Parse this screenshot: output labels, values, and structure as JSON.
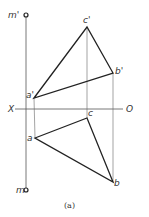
{
  "figure": {
    "caption": "(a)",
    "axis": {
      "left_label": "X",
      "right_label": "O"
    },
    "labels": {
      "m_prime": "m'",
      "m": "m",
      "a_prime": "a'",
      "b_prime": "b'",
      "c_prime": "c'",
      "a": "a",
      "b": "b",
      "c": "c"
    },
    "front_view": {
      "a_prime": [
        34,
        98
      ],
      "b_prime": [
        113,
        73
      ],
      "c_prime": [
        87,
        27
      ]
    },
    "top_view": {
      "a": [
        35,
        138
      ],
      "b": [
        113,
        182
      ],
      "c": [
        87,
        118
      ]
    },
    "m_line": {
      "x": 26,
      "top": 15,
      "bottom": 190
    },
    "x_axis_y": 109,
    "colors": {
      "line": "#222222",
      "thin": "#555555"
    }
  }
}
